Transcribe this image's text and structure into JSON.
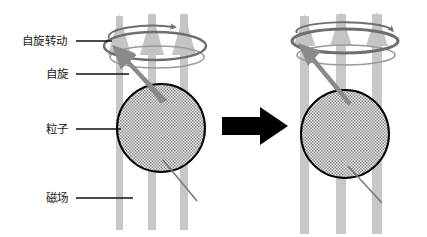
{
  "figure": {
    "kind": "scientific-diagram",
    "background_color": "#ffffff",
    "width": 427,
    "height": 237
  },
  "labels": [
    {
      "id": "spin-precession",
      "text": "自旋转动",
      "x": 22,
      "y": 45,
      "leader_x1": 75,
      "leader_x2": 110,
      "leader_y": 41
    },
    {
      "id": "spin",
      "text": "自旋",
      "x": 46,
      "y": 78,
      "leader_x1": 75,
      "leader_x2": 128,
      "leader_y": 74
    },
    {
      "id": "particle",
      "text": "粒子",
      "x": 46,
      "y": 133,
      "leader_x1": 75,
      "leader_x2": 120,
      "leader_y": 129
    },
    {
      "id": "magnetic-field",
      "text": "磁场",
      "x": 46,
      "y": 202,
      "leader_x1": 75,
      "leader_x2": 132,
      "leader_y": 198
    }
  ],
  "panels": [
    {
      "id": "left-panel",
      "name": "low-field-precession-state",
      "particle": {
        "cx": 161,
        "cy": 128,
        "r": 44
      },
      "field_bars": [
        {
          "x": 116,
          "top": 16,
          "bottom": 230,
          "width": 7
        },
        {
          "x": 148,
          "top": 14,
          "bottom": 230,
          "width": 8
        },
        {
          "x": 180,
          "top": 14,
          "bottom": 230,
          "width": 8
        }
      ],
      "field_arrowheads": [
        {
          "cx": 119.5,
          "tip_y": 14,
          "base_y": 52,
          "half_width": 12
        },
        {
          "cx": 152,
          "tip_y": 12,
          "base_y": 52,
          "half_width": 12
        },
        {
          "cx": 184,
          "tip_y": 12,
          "base_y": 52,
          "half_width": 12
        }
      ],
      "precession_ellipse": {
        "cx": 155,
        "cy": 46,
        "rx": 51,
        "ry": 14
      },
      "precession_ellipse_lower": {
        "cx": 157,
        "cy": 57,
        "rx": 47,
        "ry": 11
      },
      "rotation_arc": {
        "cx": 152,
        "cy": 35,
        "rx": 44,
        "ry": 11
      },
      "spin_arrow": {
        "x1": 164,
        "y1": 98,
        "x2": 117,
        "y2": 50
      },
      "spin_tail": {
        "x1": 163,
        "y1": 160,
        "x2": 196,
        "y2": 200
      }
    },
    {
      "id": "right-panel",
      "name": "high-field-precession-state",
      "particle": {
        "cx": 345,
        "cy": 134,
        "r": 44
      },
      "field_bars": [
        {
          "x": 300,
          "top": 16,
          "bottom": 234,
          "width": 9
        },
        {
          "x": 336,
          "top": 14,
          "bottom": 234,
          "width": 10
        },
        {
          "x": 372,
          "top": 14,
          "bottom": 234,
          "width": 10
        }
      ],
      "field_arrowheads": [
        {
          "cx": 304.5,
          "tip_y": 14,
          "base_y": 44,
          "half_width": 11
        },
        {
          "cx": 341,
          "tip_y": 12,
          "base_y": 44,
          "half_width": 11
        },
        {
          "cx": 377,
          "tip_y": 12,
          "base_y": 44,
          "half_width": 11
        }
      ],
      "precession_ellipse": {
        "cx": 345,
        "cy": 40,
        "rx": 53,
        "ry": 11
      },
      "precession_ellipse_lower": {
        "cx": 346,
        "cy": 55,
        "rx": 49,
        "ry": 10
      },
      "rotation_arc": {
        "cx": 344,
        "cy": 30,
        "rx": 47,
        "ry": 9
      },
      "spin_arrow": {
        "x1": 348,
        "y1": 102,
        "x2": 303,
        "y2": 47
      },
      "spin_tail": {
        "x1": 348,
        "y1": 166,
        "x2": 381,
        "y2": 202
      }
    }
  ],
  "transition_arrow": {
    "id": "transition-arrow",
    "shaft_x": 222,
    "shaft_y": 117,
    "shaft_w": 44,
    "shaft_h": 18,
    "head_x": 260,
    "head_tip_x": 288,
    "head_top_y": 107,
    "head_bottom_y": 145,
    "color": "#000000"
  },
  "colors": {
    "field_bar": "#c8c8c8",
    "field_arrowhead": "#c4c4c4",
    "particle_fill": "#d0d0d0",
    "particle_stroke": "#000000",
    "precession_ring": "#6e6e6e",
    "precession_ring_light": "#9a9a9a",
    "spin_arrow": "#7a7a7a",
    "leader_line": "#111111",
    "text": "#1a1a1a",
    "transition_arrow": "#000000"
  }
}
